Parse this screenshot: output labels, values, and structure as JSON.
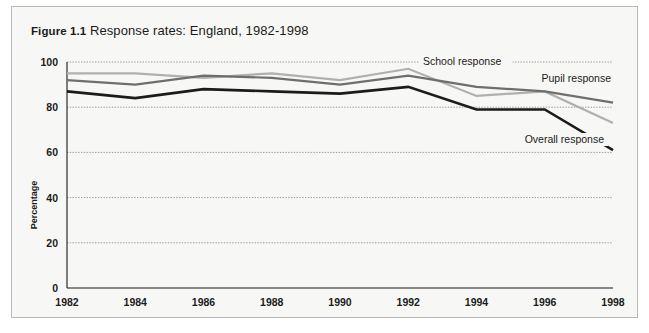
{
  "figure": {
    "number": "Figure 1.1",
    "caption": "Response rates: England, 1982-1998"
  },
  "chart_data": {
    "type": "line",
    "title": "Response rates: England, 1982-1998",
    "xlabel": "",
    "ylabel": "Percentage",
    "categories": [
      "1982",
      "1984",
      "1986",
      "1988",
      "1990",
      "1992",
      "1994",
      "1996",
      "1998"
    ],
    "x": [
      1982,
      1984,
      1986,
      1988,
      1990,
      1992,
      1994,
      1996,
      1998
    ],
    "xlim": [
      1982,
      1998
    ],
    "ylim": [
      0,
      100
    ],
    "yticks": [
      0,
      20,
      40,
      60,
      80,
      100
    ],
    "xticks": [
      1982,
      1984,
      1986,
      1988,
      1990,
      1992,
      1994,
      1996,
      1998
    ],
    "grid": true,
    "legend_position": "inline-annotations",
    "series": [
      {
        "name": "School response",
        "color": "#b0b0b0",
        "values": [
          95,
          95,
          93,
          95,
          92,
          97,
          85,
          87,
          73
        ]
      },
      {
        "name": "Pupil response",
        "color": "#6e6e6e",
        "values": [
          92,
          90,
          94,
          93,
          90,
          94,
          89,
          87,
          82
        ]
      },
      {
        "name": "Overall response",
        "color": "#1b1b1b",
        "values": [
          87,
          84,
          88,
          87,
          86,
          89,
          79,
          79,
          61
        ]
      }
    ],
    "annotations": [
      {
        "text": "School response",
        "series": "School response"
      },
      {
        "text": "Pupil response",
        "series": "Pupil response"
      },
      {
        "text": "Overall response",
        "series": "Overall response"
      }
    ]
  },
  "style": {
    "background": "#f7f7f5",
    "frame_border": "#b9b9b9",
    "grid_color": "#9a9a9a",
    "axis_color": "#1b1b1b"
  }
}
